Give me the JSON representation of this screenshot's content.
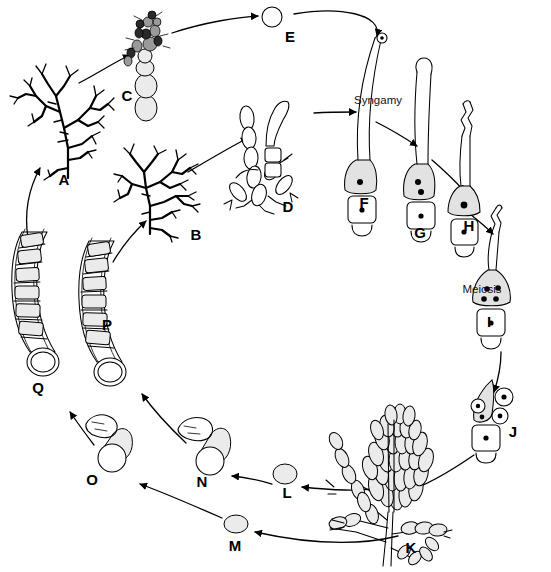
{
  "diagram": {
    "type": "life-cycle",
    "background_color": "#ffffff",
    "line_color": "#000000",
    "process_labels": [
      {
        "id": "syngamy",
        "text": "Syngamy",
        "x": 378,
        "y": 104
      },
      {
        "id": "meiosis",
        "text": "Meiosis",
        "x": 457,
        "y": 293
      }
    ],
    "stages": [
      {
        "id": "A",
        "label": "A",
        "x": 64,
        "y": 185,
        "description": "branched dark thallus"
      },
      {
        "id": "B",
        "label": "B",
        "x": 196,
        "y": 240,
        "description": "branched dark thallus"
      },
      {
        "id": "C",
        "label": "C",
        "x": 127,
        "y": 101,
        "description": "conidiophore with spores"
      },
      {
        "id": "D",
        "label": "D",
        "x": 288,
        "y": 212,
        "description": "hyphal filament cluster"
      },
      {
        "id": "E",
        "label": "E",
        "x": 290,
        "y": 42,
        "description": "single spore"
      },
      {
        "id": "F",
        "label": "F",
        "x": 364,
        "y": 208,
        "description": "gametangium with one nucleus"
      },
      {
        "id": "G",
        "label": "G",
        "x": 420,
        "y": 238,
        "description": "gametangium with two nuclei"
      },
      {
        "id": "H",
        "label": "H",
        "x": 469,
        "y": 231,
        "description": "zygote cell with single nucleus"
      },
      {
        "id": "I",
        "label": "I",
        "x": 489,
        "y": 327,
        "description": "cell with four meiotic nuclei"
      },
      {
        "id": "J",
        "label": "J",
        "x": 513,
        "y": 437,
        "description": "cell releasing nuclei"
      },
      {
        "id": "K",
        "label": "K",
        "x": 441,
        "y": 548,
        "description": "dense sporangial cluster"
      },
      {
        "id": "L",
        "label": "L",
        "x": 287,
        "y": 494,
        "description": "released spore"
      },
      {
        "id": "M",
        "label": "M",
        "x": 235,
        "y": 551,
        "description": "released spore"
      },
      {
        "id": "N",
        "label": "N",
        "x": 202,
        "y": 487,
        "description": "germinating spore with germ tube"
      },
      {
        "id": "O",
        "label": "O",
        "x": 92,
        "y": 485,
        "description": "germinating spore with germ tube"
      },
      {
        "id": "P",
        "label": "P",
        "x": 107,
        "y": 330,
        "description": "multicellular septate filament"
      },
      {
        "id": "Q",
        "label": "Q",
        "x": 38,
        "y": 393,
        "description": "multicellular septate filament"
      }
    ],
    "transitions": [
      {
        "from": "Q",
        "to": "A"
      },
      {
        "from": "A",
        "to": "C"
      },
      {
        "from": "C",
        "to": "E"
      },
      {
        "from": "E",
        "to": "F"
      },
      {
        "from": "P",
        "to": "B"
      },
      {
        "from": "B",
        "to": "D"
      },
      {
        "from": "D",
        "to": "F"
      },
      {
        "from": "F",
        "to": "G"
      },
      {
        "from": "G",
        "to": "H"
      },
      {
        "from": "H",
        "to": "I"
      },
      {
        "from": "I",
        "to": "J"
      },
      {
        "from": "J",
        "to": "K"
      },
      {
        "from": "K",
        "to": "L"
      },
      {
        "from": "K",
        "to": "M"
      },
      {
        "from": "L",
        "to": "N"
      },
      {
        "from": "M",
        "to": "O"
      },
      {
        "from": "N",
        "to": "P"
      },
      {
        "from": "O",
        "to": "Q"
      }
    ]
  }
}
